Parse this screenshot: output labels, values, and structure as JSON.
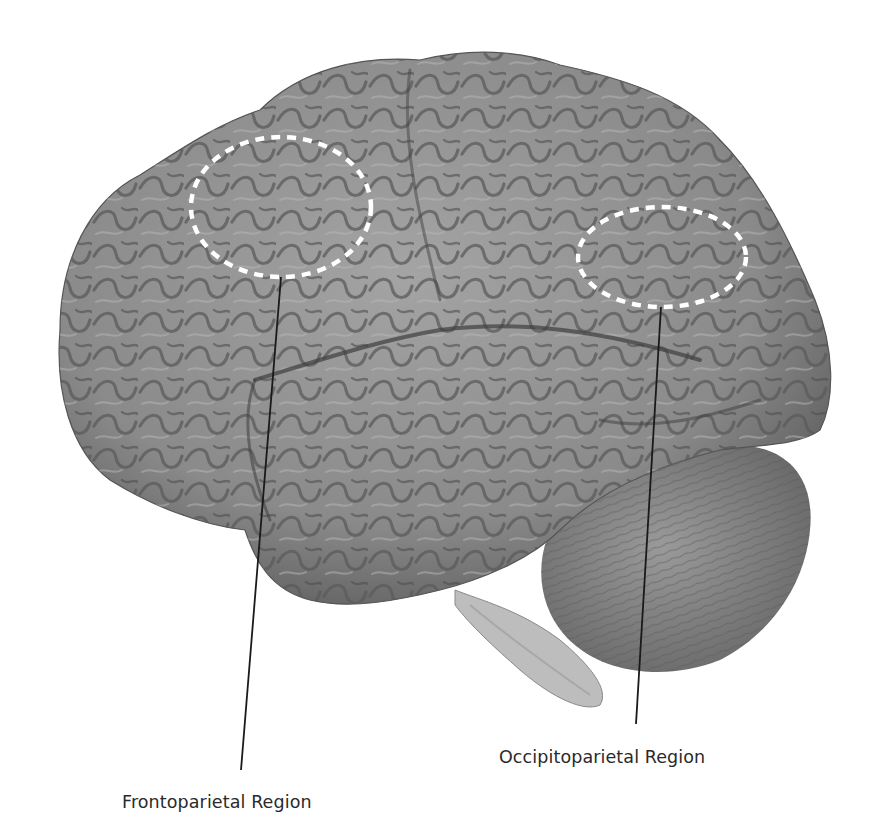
{
  "figure": {
    "background_color": "#ffffff",
    "brain_tone": "#8e8e8e",
    "highlight_stroke_color": "#ffffff",
    "leader_line_color": "#1a1a1a",
    "regions": [
      {
        "id": "frontoparietal",
        "label": "Frontoparietal Region",
        "ellipse": {
          "cx": 281,
          "cy": 207,
          "rx": 90,
          "ry": 70
        },
        "leader_line": {
          "x1": 281,
          "y1": 277,
          "x2": 241,
          "y2": 770
        },
        "label_position": {
          "x": 122,
          "y": 812
        }
      },
      {
        "id": "occipitoparietal",
        "label": "Occipitoparietal Region",
        "ellipse": {
          "cx": 662,
          "cy": 257,
          "rx": 84,
          "ry": 50
        },
        "leader_line": {
          "x1": 661,
          "y1": 307,
          "x2": 636,
          "y2": 724
        },
        "label_position": {
          "x": 499,
          "y": 767
        }
      }
    ]
  }
}
